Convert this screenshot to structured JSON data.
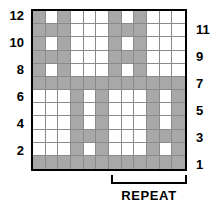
{
  "chart_data": {
    "type": "heatmap",
    "title": "",
    "xlabel": "",
    "ylabel": "",
    "columns": 12,
    "rows": 12,
    "legend": {
      "filled": "pattern stitch",
      "empty": "background stitch"
    },
    "colors": {
      "filled": "#a8a8a8",
      "empty": "#ffffff",
      "gridline": "#8a8a8a",
      "border": "#000000",
      "text": "#000000"
    },
    "row_labels_left": [
      "12",
      "",
      "10",
      "",
      "8",
      "",
      "6",
      "",
      "4",
      "",
      "2",
      ""
    ],
    "row_labels_right": [
      "",
      "11",
      "",
      "9",
      "",
      "7",
      "",
      "5",
      "",
      "3",
      "",
      "1"
    ],
    "row_numbers_top_to_bottom": [
      12,
      11,
      10,
      9,
      8,
      7,
      6,
      5,
      4,
      3,
      2,
      1
    ],
    "grid_top_to_bottom": [
      [
        1,
        0,
        1,
        0,
        0,
        0,
        1,
        0,
        1,
        0,
        0,
        0
      ],
      [
        1,
        1,
        1,
        0,
        0,
        0,
        1,
        1,
        1,
        0,
        0,
        0
      ],
      [
        1,
        0,
        1,
        0,
        0,
        0,
        1,
        0,
        1,
        0,
        0,
        0
      ],
      [
        1,
        1,
        1,
        0,
        0,
        0,
        1,
        1,
        1,
        0,
        0,
        0
      ],
      [
        1,
        0,
        1,
        0,
        0,
        0,
        1,
        0,
        1,
        0,
        0,
        0
      ],
      [
        1,
        1,
        1,
        1,
        1,
        1,
        1,
        1,
        1,
        1,
        1,
        1
      ],
      [
        0,
        0,
        0,
        1,
        0,
        1,
        0,
        0,
        0,
        1,
        0,
        1
      ],
      [
        0,
        0,
        0,
        1,
        0,
        1,
        0,
        0,
        0,
        1,
        0,
        1
      ],
      [
        0,
        0,
        0,
        1,
        0,
        1,
        0,
        0,
        0,
        1,
        0,
        1
      ],
      [
        0,
        0,
        0,
        1,
        1,
        1,
        0,
        0,
        0,
        1,
        1,
        1
      ],
      [
        0,
        0,
        0,
        1,
        0,
        1,
        0,
        0,
        0,
        1,
        0,
        1
      ],
      [
        1,
        1,
        1,
        1,
        1,
        1,
        1,
        1,
        1,
        1,
        1,
        1
      ]
    ]
  },
  "repeat": {
    "label": "REPEAT",
    "start_column": 7,
    "end_column": 12,
    "width_columns": 6
  }
}
